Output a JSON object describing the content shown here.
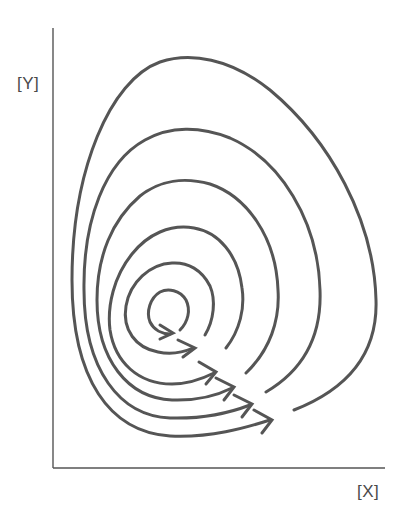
{
  "diagram": {
    "type": "phase-portrait-spiral",
    "y_axis_label": "[Y]",
    "x_axis_label": "[X]",
    "line_color": "#555555",
    "axis_color": "#555555",
    "loops": 6,
    "direction": "counterclockwise-inward spiral with arrowheads"
  }
}
